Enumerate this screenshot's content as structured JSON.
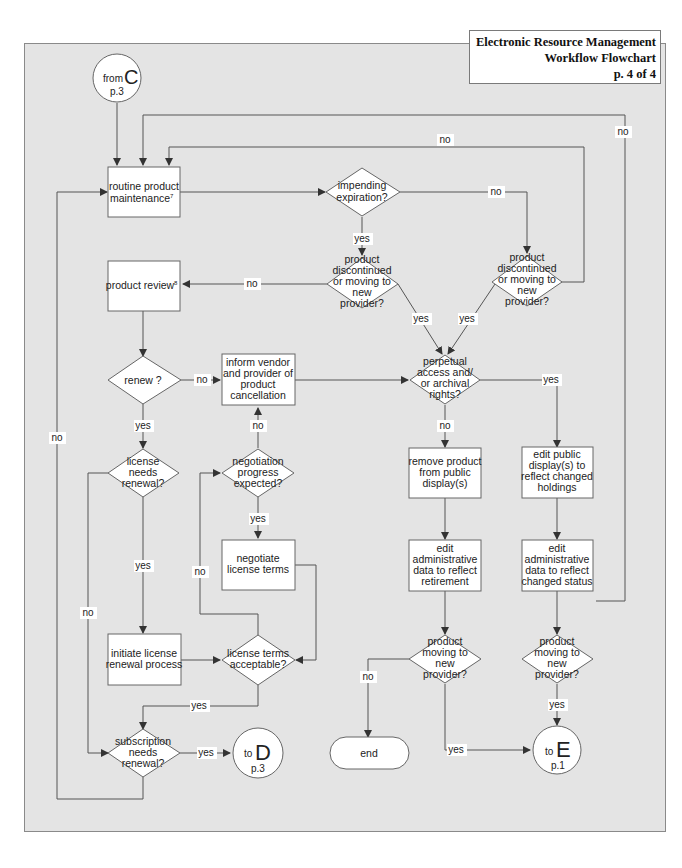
{
  "title": {
    "line1": "Electronic Resource Management",
    "line2": "Workflow Flowchart",
    "line3": "p. 4 of 4"
  },
  "colors": {
    "panel_bg": "#e4e4e4",
    "node_fill": "#ffffff",
    "line": "#555555"
  },
  "connectors": {
    "from_c": {
      "prefix": "from",
      "letter": "C",
      "page": "p.3"
    },
    "to_d": {
      "prefix": "to",
      "letter": "D",
      "page": "p.3"
    },
    "to_e": {
      "prefix": "to",
      "letter": "E",
      "page": "p.1"
    }
  },
  "nodes": {
    "routine_maintenance": {
      "lines": [
        "routine product",
        "maintenance"
      ],
      "footnote": "7"
    },
    "impending_expiration": {
      "lines": [
        "impending",
        "expiration?"
      ]
    },
    "discontinued_left": {
      "lines": [
        "product",
        "discontinued",
        "or moving to",
        "new",
        "provider?"
      ]
    },
    "discontinued_right": {
      "lines": [
        "product",
        "discontinued",
        "or moving to",
        "new",
        "provider?"
      ]
    },
    "product_review": {
      "lines": [
        "product review"
      ],
      "footnote": "8"
    },
    "renew": {
      "lines": [
        "renew ?"
      ]
    },
    "inform_vendor": {
      "lines": [
        "inform vendor",
        "and provider of",
        "product",
        "cancellation"
      ]
    },
    "perpetual_access": {
      "lines": [
        "perpetual",
        "access and/",
        "or archival",
        "rights?"
      ]
    },
    "license_needs_renewal": {
      "lines": [
        "license",
        "needs",
        "renewal?"
      ]
    },
    "negotiation_progress": {
      "lines": [
        "negotiation",
        "progress",
        "expected?"
      ]
    },
    "negotiate_terms": {
      "lines": [
        "negotiate",
        "license terms"
      ]
    },
    "remove_product": {
      "lines": [
        "remove product",
        "from public",
        "display(s)"
      ]
    },
    "edit_public_display": {
      "lines": [
        "edit public",
        "display(s) to",
        "reflect changed",
        "holdings"
      ]
    },
    "edit_admin_retirement": {
      "lines": [
        "edit",
        "administrative",
        "data to reflect",
        "retirement"
      ]
    },
    "edit_admin_status": {
      "lines": [
        "edit",
        "administrative",
        "data to reflect",
        "changed status"
      ]
    },
    "initiate_renewal": {
      "lines": [
        "initiate license",
        "renewal process"
      ]
    },
    "license_terms_acceptable": {
      "lines": [
        "license terms",
        "acceptable?"
      ]
    },
    "moving_left": {
      "lines": [
        "product",
        "moving to",
        "new",
        "provider?"
      ]
    },
    "moving_right": {
      "lines": [
        "product",
        "moving to",
        "new",
        "provider?"
      ]
    },
    "subscription_renewal": {
      "lines": [
        "subscription",
        "needs",
        "renewal?"
      ]
    },
    "end": {
      "lines": [
        "end"
      ]
    }
  },
  "edge_labels": {
    "top_loop_no": "no",
    "right_loop_no": "no",
    "expiration_no": "no",
    "expiration_yes": "yes",
    "disc_left_no": "no",
    "disc_left_yes": "yes",
    "disc_right_yes": "yes",
    "renew_no": "no",
    "renew_yes": "yes",
    "perpetual_yes": "yes",
    "perpetual_no": "no",
    "negotiation_no": "no",
    "negotiation_yes": "yes",
    "license_renewal_yes": "yes",
    "license_renewal_no": "no",
    "terms_no": "no",
    "terms_yes": "yes",
    "subscription_yes": "yes",
    "subscription_no": "no",
    "moving_left_no": "no",
    "moving_left_yes": "yes",
    "moving_right_yes": "yes"
  }
}
